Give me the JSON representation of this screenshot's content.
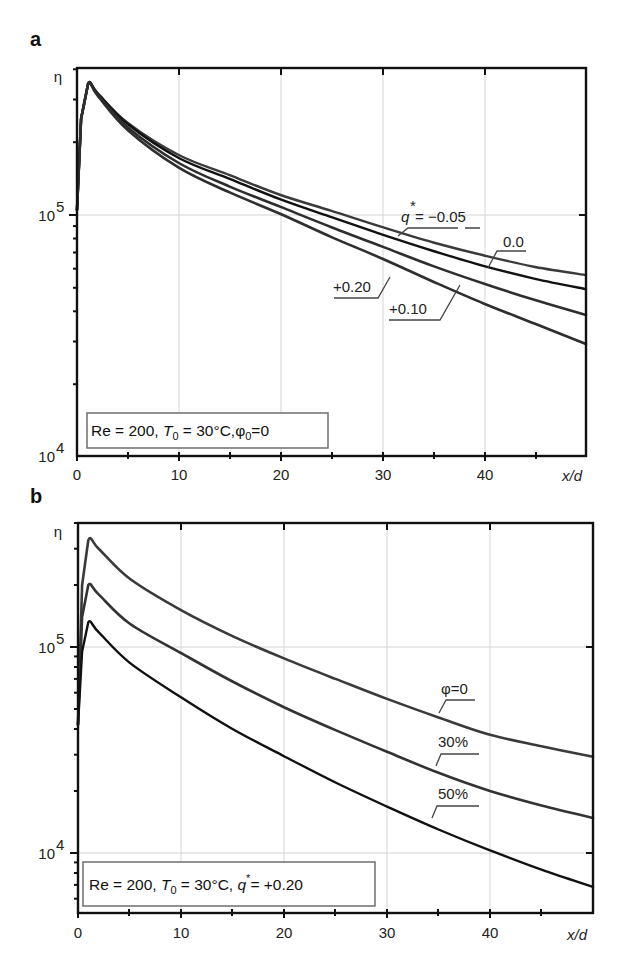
{
  "figure": {
    "panels": [
      {
        "id": "a",
        "letter": "a"
      },
      {
        "id": "b",
        "letter": "b"
      }
    ]
  },
  "chart_data": [
    {
      "panel": "a",
      "type": "line",
      "title": "",
      "xlabel": "x/d",
      "ylabel": "η",
      "yscale": "log",
      "xlim": [
        0,
        50
      ],
      "ylim": [
        10000,
        400000
      ],
      "x_ticks": [
        0,
        10,
        20,
        30,
        40
      ],
      "x_tick_labels": [
        "0",
        "10",
        "20",
        "30",
        "40"
      ],
      "y_tick_labels": [
        "10^5",
        "10^4"
      ],
      "grid": true,
      "legend_box": {
        "text": "Re = 200, T0 = 30°C, φ0 = 0",
        "position": "lower-left"
      },
      "series": [
        {
          "name": "q* = −0.05",
          "label": "q* = −0.05",
          "x": [
            0,
            0.4,
            1.1,
            2,
            5,
            10,
            15,
            20,
            25,
            30,
            35,
            40,
            45,
            50
          ],
          "values": [
            105000,
            250000,
            350000,
            320000,
            240000,
            177000,
            146000,
            121000,
            104000,
            89000,
            77000,
            68000,
            61000,
            56500
          ]
        },
        {
          "name": "q* = 0.0",
          "label": "0.0",
          "x": [
            0,
            0.4,
            1.1,
            2,
            5,
            10,
            15,
            20,
            25,
            30,
            35,
            40,
            45,
            50
          ],
          "values": [
            105000,
            250000,
            350000,
            318000,
            237000,
            172000,
            141000,
            116000,
            98000,
            83000,
            71000,
            61500,
            54500,
            49400
          ]
        },
        {
          "name": "q* = +0.10",
          "label": "+0.10",
          "x": [
            0,
            0.4,
            1.1,
            2,
            5,
            10,
            15,
            20,
            25,
            30,
            35,
            40,
            45,
            50
          ],
          "values": [
            105000,
            250000,
            350000,
            315000,
            230000,
            164000,
            131000,
            108000,
            89000,
            74000,
            61500,
            52000,
            44500,
            38600
          ]
        },
        {
          "name": "q* = +0.20",
          "label": "+0.20",
          "x": [
            0,
            0.4,
            1.1,
            2,
            5,
            10,
            15,
            20,
            25,
            30,
            35,
            40,
            45,
            50
          ],
          "values": [
            105000,
            250000,
            350000,
            312000,
            224000,
            157000,
            124000,
            101000,
            81000,
            66000,
            53000,
            43000,
            35500,
            29300
          ]
        }
      ]
    },
    {
      "panel": "b",
      "type": "line",
      "title": "",
      "xlabel": "x/d",
      "ylabel": "η",
      "yscale": "log",
      "xlim": [
        0,
        50
      ],
      "ylim": [
        5100,
        400000
      ],
      "x_ticks": [
        0,
        10,
        20,
        30,
        40
      ],
      "x_tick_labels": [
        "0",
        "10",
        "20",
        "30",
        "40"
      ],
      "y_tick_labels": [
        "10^5",
        "10^4"
      ],
      "grid": true,
      "legend_box": {
        "text": "Re = 200, T0 = 30°C, q* = +0.20",
        "position": "lower-left"
      },
      "series": [
        {
          "name": "φ = 0",
          "label": "φ=0",
          "x": [
            0,
            0.4,
            1,
            2,
            5,
            10,
            15,
            20,
            25,
            30,
            35,
            40,
            45,
            50
          ],
          "values": [
            42000,
            200000,
            330000,
            300000,
            215000,
            151000,
            113000,
            88000,
            70000,
            56000,
            45500,
            37500,
            33000,
            29300
          ]
        },
        {
          "name": "φ = 30%",
          "label": "30%",
          "x": [
            0,
            0.4,
            1,
            2,
            5,
            10,
            15,
            20,
            25,
            30,
            35,
            40,
            45,
            50
          ],
          "values": [
            42000,
            140000,
            200000,
            180000,
            130000,
            93500,
            68000,
            51000,
            39500,
            31000,
            24500,
            20000,
            17000,
            14800
          ]
        },
        {
          "name": "φ = 50%",
          "label": "50%",
          "x": [
            0,
            0.4,
            1,
            2,
            5,
            10,
            15,
            20,
            25,
            30,
            35,
            40,
            45,
            50
          ],
          "values": [
            42000,
            95000,
            132000,
            118000,
            84000,
            57000,
            40000,
            29500,
            22000,
            16800,
            13000,
            10300,
            8300,
            6840
          ]
        }
      ]
    }
  ],
  "labels": {
    "x_axis": "x/d",
    "y_axis": "η",
    "y_tick_1e5_base": "10",
    "y_tick_1e5_exp": "5",
    "y_tick_1e4_base": "10",
    "y_tick_1e4_exp": "4"
  },
  "legend_a": {
    "part1": "Re = 200, ",
    "T": "T",
    "T_sub": "0",
    "part2": " = 30°C,φ",
    "phi_sub": "0",
    "part3": "=0"
  },
  "legend_b": {
    "part1": "Re = 200, ",
    "T": "T",
    "T_sub": "0",
    "part2": " = 30°C, ",
    "q": "q",
    "q_sup": "*",
    "part3": "= +0.20"
  },
  "curve_labels_a": {
    "q_prefix": "q",
    "q_star": "*",
    "q_value": "= −0.05",
    "zero": "0.0",
    "plus20": "+0.20",
    "plus10": "+0.10"
  },
  "curve_labels_b": {
    "phi0": "φ=0",
    "p30": "30%",
    "p50": "50%"
  },
  "colors": {
    "curve_dark": "#111111",
    "curve_gray": "#3a3a3a",
    "grid": "#d4d4d4",
    "frame": "#111111"
  }
}
